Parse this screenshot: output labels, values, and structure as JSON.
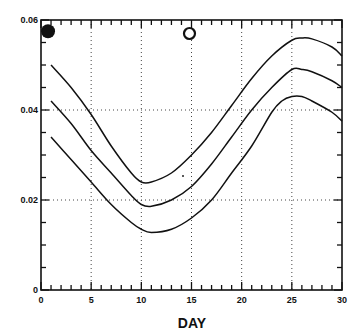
{
  "chart_data": {
    "type": "line",
    "title": "",
    "xlabel": "DAY",
    "ylabel": "",
    "xlim": [
      0,
      30
    ],
    "ylim": [
      0,
      0.06
    ],
    "x_ticks": [
      0,
      5,
      10,
      15,
      20,
      25,
      30
    ],
    "x_tick_labels": [
      "0",
      "5",
      "10",
      "15",
      "20",
      "25",
      "30"
    ],
    "y_ticks": [
      0,
      0.02,
      0.04,
      0.06
    ],
    "y_tick_labels": [
      "0",
      "0.02",
      "0.04",
      "0.06"
    ],
    "x_minor_step": 1,
    "y_minor_step": 0.005,
    "grid": "dotted, at major ticks",
    "legend": null,
    "series": [
      {
        "name": "upper",
        "x": [
          1,
          3,
          5,
          7,
          9,
          10,
          11,
          13,
          15,
          17,
          19,
          21,
          23,
          25,
          26,
          27,
          29,
          30
        ],
        "values": [
          0.05,
          0.045,
          0.039,
          0.032,
          0.026,
          0.024,
          0.024,
          0.026,
          0.03,
          0.035,
          0.041,
          0.047,
          0.052,
          0.0555,
          0.056,
          0.0558,
          0.054,
          0.052
        ]
      },
      {
        "name": "middle",
        "x": [
          1,
          3,
          5,
          7,
          9,
          10,
          11,
          13,
          15,
          17,
          19,
          21,
          23,
          25,
          26,
          27,
          29,
          30
        ],
        "values": [
          0.042,
          0.037,
          0.031,
          0.026,
          0.021,
          0.019,
          0.0186,
          0.02,
          0.023,
          0.028,
          0.034,
          0.04,
          0.045,
          0.049,
          0.049,
          0.0485,
          0.0465,
          0.045
        ]
      },
      {
        "name": "lower",
        "x": [
          1,
          3,
          5,
          7,
          9,
          10,
          11,
          13,
          15,
          17,
          19,
          21,
          23,
          24,
          25,
          26,
          27,
          29,
          30
        ],
        "values": [
          0.034,
          0.029,
          0.024,
          0.019,
          0.015,
          0.0135,
          0.0128,
          0.0135,
          0.016,
          0.02,
          0.026,
          0.032,
          0.0395,
          0.042,
          0.043,
          0.043,
          0.042,
          0.0395,
          0.0375
        ]
      }
    ],
    "markers": [
      {
        "name": "filled-circle",
        "x": 0.7,
        "y": 0.0575,
        "filled": true
      },
      {
        "name": "open-circle",
        "x": 14.8,
        "y": 0.057,
        "filled": false
      }
    ],
    "annotations": []
  },
  "colors": {
    "ink": "#111111",
    "background": "#ffffff"
  }
}
